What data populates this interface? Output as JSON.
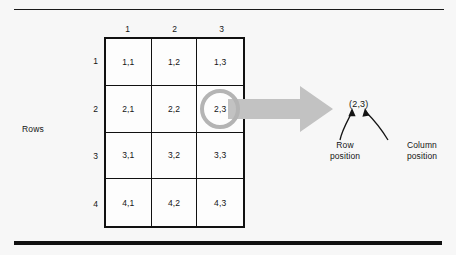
{
  "figure": {
    "rows_axis_label": "Rows",
    "column_headers": [
      "1",
      "2",
      "3"
    ],
    "row_headers": [
      "1",
      "2",
      "3",
      "4"
    ],
    "cells": [
      [
        "1,1",
        "1,2",
        "1,3"
      ],
      [
        "2,1",
        "2,2",
        "2,3"
      ],
      [
        "3,1",
        "3,2",
        "3,3"
      ],
      [
        "4,1",
        "4,2",
        "4,3"
      ]
    ],
    "highlighted_cell": "2,3",
    "callout": {
      "coordinate": "(2,3)",
      "row_leader_line1": "Row",
      "row_leader_line2": "position",
      "column_leader_line1": "Column",
      "column_leader_line2": "position"
    },
    "colors": {
      "background": "#f7f7f7",
      "ink": "#111111",
      "arrow_gray": "#c2c2c2",
      "ring_gray": "#b4b4b4"
    }
  }
}
